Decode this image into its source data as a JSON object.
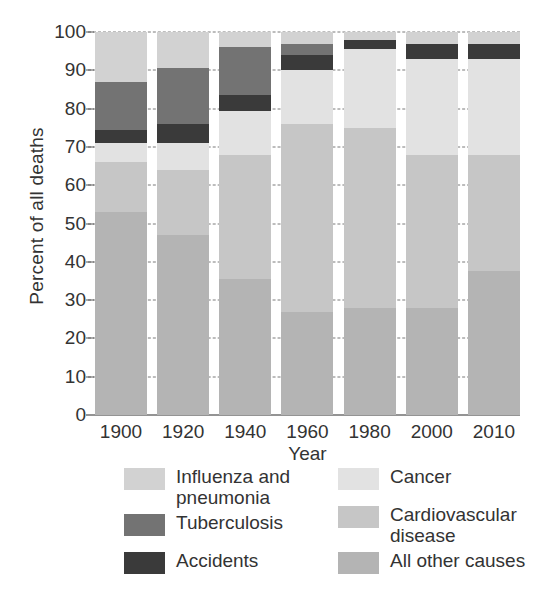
{
  "chart_data": {
    "type": "bar",
    "stacked": true,
    "title": "",
    "xlabel": "Year",
    "ylabel": "Percent of all deaths",
    "categories": [
      "1900",
      "1920",
      "1940",
      "1960",
      "1980",
      "2000",
      "2010"
    ],
    "ylim": [
      0,
      100
    ],
    "yticks": [
      0,
      10,
      20,
      30,
      40,
      50,
      60,
      70,
      80,
      90,
      100
    ],
    "ytick_labels": [
      "0",
      "10",
      "20",
      "30",
      "40",
      "50",
      "60",
      "70",
      "80",
      "90",
      "100"
    ],
    "grid": true,
    "grid_style": "dashed horizontal",
    "legend_position": "below",
    "series": [
      {
        "name": "All other causes",
        "color": "#b4b4b4",
        "values": [
          53,
          47,
          35.5,
          27,
          28,
          28,
          37.5
        ]
      },
      {
        "name": "Cardiovascular disease",
        "color": "#c6c6c6",
        "values": [
          13,
          17,
          32.5,
          49,
          47,
          40,
          30.5
        ]
      },
      {
        "name": "Cancer",
        "color": "#e2e2e2",
        "values": [
          5,
          7,
          11.5,
          14,
          20.5,
          25,
          25
        ]
      },
      {
        "name": "Accidents",
        "color": "#3a3a3a",
        "values": [
          3.5,
          5,
          4,
          4,
          2.5,
          4,
          4
        ]
      },
      {
        "name": "Tuberculosis",
        "color": "#737373",
        "values": [
          12.5,
          14.5,
          12.5,
          3,
          0,
          0,
          0
        ]
      },
      {
        "name": "Influenza and pneumonia",
        "color": "#d2d2d2",
        "values": [
          13,
          9.5,
          4,
          3,
          2,
          3,
          3
        ]
      }
    ]
  },
  "legend": {
    "left_column": [
      {
        "label": "Influenza and pneumonia",
        "color": "#d2d2d2",
        "swatch_name": "legend-swatch-influenza"
      },
      {
        "label": "Tuberculosis",
        "color": "#737373",
        "swatch_name": "legend-swatch-tuberculosis"
      },
      {
        "label": "Accidents",
        "color": "#3a3a3a",
        "swatch_name": "legend-swatch-accidents"
      }
    ],
    "right_column": [
      {
        "label": "Cancer",
        "color": "#e2e2e2",
        "swatch_name": "legend-swatch-cancer"
      },
      {
        "label": "Cardiovascular disease",
        "color": "#c6c6c6",
        "swatch_name": "legend-swatch-cardiovascular"
      },
      {
        "label": "All other causes",
        "color": "#b4b4b4",
        "swatch_name": "legend-swatch-all-other"
      }
    ]
  }
}
